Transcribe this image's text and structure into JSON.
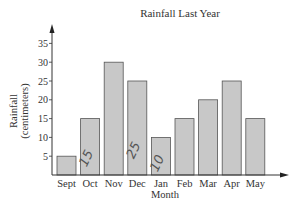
{
  "chart_data": {
    "type": "bar",
    "title": "Rainfall Last Year",
    "xlabel": "Month",
    "ylabel": "Rainfall (centimeters)",
    "categories": [
      "Sept",
      "Oct",
      "Nov",
      "Dec",
      "Jan",
      "Feb",
      "Mar",
      "Apr",
      "May"
    ],
    "values": [
      5,
      15,
      30,
      25,
      10,
      15,
      20,
      25,
      15
    ],
    "yticks": [
      5,
      10,
      15,
      20,
      25,
      30,
      35
    ],
    "ylim": [
      0,
      37
    ],
    "grid": false,
    "legend": null,
    "annotations": [
      "15 (handwritten on Oct)",
      "25 (handwritten on Dec)",
      "10 (handwritten on Jan)"
    ],
    "bar_color": "#c8c8c8",
    "bar_edge_color": "#555555"
  }
}
